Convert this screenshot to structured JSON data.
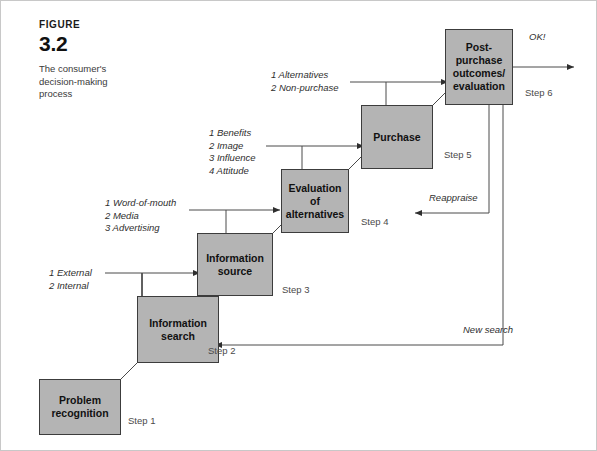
{
  "figure": {
    "kicker": "FIGURE",
    "number": "3.2",
    "caption": "The consumer's decision-making process"
  },
  "nodes": [
    {
      "id": "problem-recognition",
      "label": "Problem\nrecognition",
      "step": "Step 1"
    },
    {
      "id": "information-search",
      "label": "Information\nsearch",
      "step": "Step 2"
    },
    {
      "id": "information-source",
      "label": "Information\nsource",
      "step": "Step 3"
    },
    {
      "id": "evaluation",
      "label": "Evaluation\nof\nalternatives",
      "step": "Step 4"
    },
    {
      "id": "purchase",
      "label": "Purchase",
      "step": "Step 5"
    },
    {
      "id": "post-purchase",
      "label": "Post-\npurchase\noutcomes/\nevaluation",
      "step": "Step 6"
    }
  ],
  "input_labels": [
    {
      "id": "inputs-information-source",
      "text": "1 External\n2 Internal"
    },
    {
      "id": "inputs-evaluation",
      "text": "1 Word-of-mouth\n2 Media\n3 Advertising"
    },
    {
      "id": "inputs-purchase",
      "text": "1 Benefits\n2 Image\n3 Influence\n4 Attitude"
    },
    {
      "id": "inputs-post-purchase",
      "text": "1 Alternatives\n2 Non-purchase"
    }
  ],
  "flow_labels": [
    {
      "id": "ok-outcome",
      "text": "OK!"
    },
    {
      "id": "reappraise",
      "text": "Reappraise"
    },
    {
      "id": "new-search",
      "text": "New search"
    }
  ],
  "colors": {
    "node_fill": "#b4b4b4",
    "node_border": "#3c3c3c",
    "line": "#4a4a4a",
    "frame": "#c8c8c8"
  }
}
